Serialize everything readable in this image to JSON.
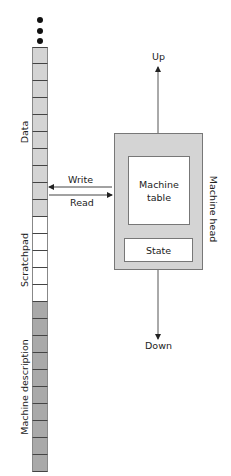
{
  "colors": {
    "data_cell": "#d4d4d4",
    "scratchpad_cell": "#ffffff",
    "description_cell": "#a9a9a9",
    "head_fill": "#d4d4d4",
    "line": "#444444"
  },
  "tape": {
    "continuation_icon": "vertical-ellipsis",
    "sections": [
      {
        "label": "Data",
        "cells": 10,
        "color_key": "data_cell"
      },
      {
        "label": "Scratchpad",
        "cells": 5,
        "color_key": "scratchpad_cell"
      },
      {
        "label": "Machine description",
        "cells": 10,
        "color_key": "description_cell"
      }
    ]
  },
  "arrows": {
    "write": "Write",
    "read": "Read",
    "up": "Up",
    "down": "Down"
  },
  "machine_head": {
    "label": "Machine head",
    "table_label_line1": "Machine",
    "table_label_line2": "table",
    "state_label": "State"
  }
}
